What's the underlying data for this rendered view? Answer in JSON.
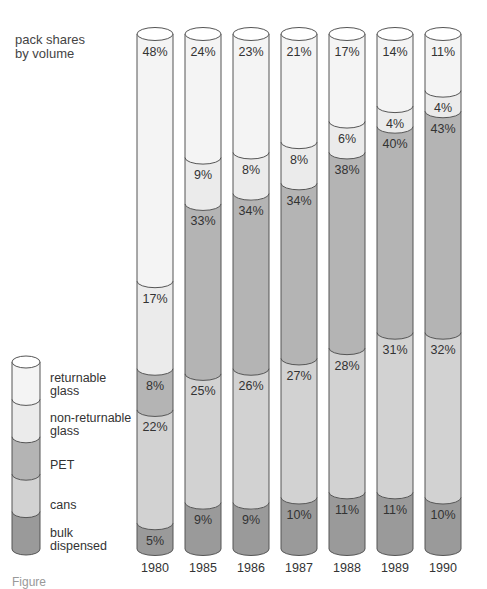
{
  "chart_data": {
    "type": "bar",
    "subtype": "stacked-100-cylinder",
    "title": "pack shares by volume",
    "title_lines": [
      "pack shares",
      "by volume"
    ],
    "xlabel": "",
    "ylabel": "",
    "ylim": [
      0,
      100
    ],
    "grid": false,
    "legend_position": "left-bottom",
    "categories": [
      "1980",
      "1985",
      "1986",
      "1987",
      "1988",
      "1989",
      "1990"
    ],
    "series": [
      {
        "name": "bulk dispensed",
        "color": "#9a9a9a",
        "values": [
          5,
          9,
          9,
          10,
          11,
          11,
          10
        ]
      },
      {
        "name": "cans",
        "color": "#d2d2d2",
        "values": [
          22,
          25,
          26,
          27,
          28,
          31,
          32
        ]
      },
      {
        "name": "PET",
        "color": "#b4b4b4",
        "values": [
          8,
          33,
          34,
          34,
          38,
          40,
          43
        ]
      },
      {
        "name": "non-returnable glass",
        "color": "#ebebeb",
        "values": [
          17,
          9,
          8,
          8,
          6,
          4,
          4
        ]
      },
      {
        "name": "returnable glass",
        "color": "#f4f4f4",
        "values": [
          48,
          24,
          23,
          21,
          17,
          14,
          11
        ]
      }
    ],
    "value_labels": [
      [
        "5%",
        "22%",
        "8%",
        "17%",
        "48%"
      ],
      [
        "9%",
        "25%",
        "33%",
        "9%",
        "24%"
      ],
      [
        "9%",
        "26%",
        "34%",
        "8%",
        "23%"
      ],
      [
        "10%",
        "27%",
        "34%",
        "8%",
        "21%"
      ],
      [
        "11%",
        "28%",
        "38%",
        "6%",
        "17%"
      ],
      [
        "11%",
        "31%",
        "40%",
        "4%",
        "14%"
      ],
      [
        "10%",
        "32%",
        "43%",
        "4%",
        "11%"
      ]
    ]
  },
  "title": {
    "line1": "pack shares",
    "line2": "by volume"
  },
  "legend": {
    "items": [
      {
        "line1": "returnable",
        "line2": "glass"
      },
      {
        "line1": "non-returnable",
        "line2": "glass"
      },
      {
        "line1": "PET",
        "line2": ""
      },
      {
        "line1": "cans",
        "line2": ""
      },
      {
        "line1": "bulk",
        "line2": "dispensed"
      }
    ]
  },
  "caption": "Figure"
}
